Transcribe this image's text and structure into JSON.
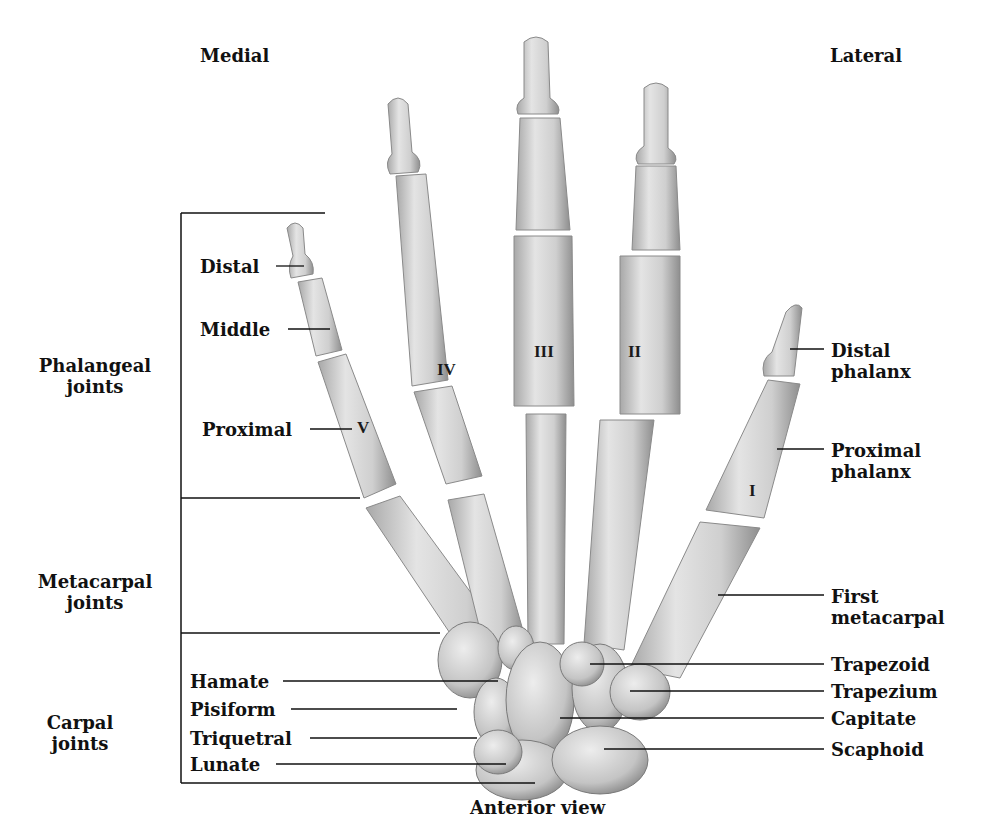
{
  "orientation": {
    "medial": "Medial",
    "lateral": "Lateral"
  },
  "caption": "Anterior view",
  "joint_groups": [
    {
      "label_line1": "Phalangeal",
      "label_line2": "joints"
    },
    {
      "label_line1": "Metacarpal",
      "label_line2": "joints"
    },
    {
      "label_line1": "Carpal",
      "label_line2": "joints"
    }
  ],
  "phalanx_labels_left": [
    "Distal",
    "Middle",
    "Proximal"
  ],
  "digit_numerals": [
    "I",
    "II",
    "III",
    "IV",
    "V"
  ],
  "thumb_labels": [
    {
      "line1": "Distal",
      "line2": "phalanx"
    },
    {
      "line1": "Proximal",
      "line2": "phalanx"
    },
    {
      "line1": "First",
      "line2": "metacarpal"
    }
  ],
  "carpal_left": [
    "Hamate",
    "Pisiform",
    "Triquetral",
    "Lunate"
  ],
  "carpal_right": [
    "Trapezoid",
    "Trapezium",
    "Capitate",
    "Scaphoid"
  ],
  "colors": {
    "bone": "#d9d9d9",
    "bone_shadow": "#9a9a9a",
    "line": "#111111",
    "background": "#ffffff"
  }
}
